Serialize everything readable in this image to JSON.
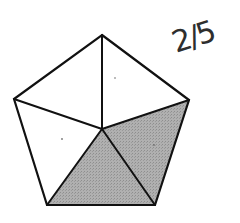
{
  "figure": {
    "shape": "regular pentagon divided into 5 triangles from center",
    "total_parts": 5,
    "shaded_parts": 2,
    "colors": {
      "stroke": "#111111",
      "shaded_fill": "#a9a9a9",
      "unshaded_fill": "#ffffff",
      "background": "#ffffff"
    },
    "vertices": {
      "top": [
        102,
        35
      ],
      "right": [
        189,
        100
      ],
      "bottom_right": [
        155,
        205
      ],
      "bottom_left": [
        47,
        205
      ],
      "left": [
        14,
        99
      ],
      "center": [
        102,
        129
      ]
    }
  },
  "annotation": {
    "text": "2/5",
    "style": "handwritten"
  }
}
